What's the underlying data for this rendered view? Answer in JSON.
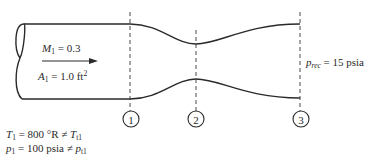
{
  "diagram": {
    "type": "converging-diverging duct (diffuser) schematic",
    "inlet": {
      "mach_symbol": "M",
      "mach_sub": "1",
      "mach_value": " = 0.3",
      "area_symbol": "A",
      "area_sub": "1",
      "area_value": " = 1.0 ft",
      "area_sup": "2",
      "flow_arrow": "arrow-right"
    },
    "conditions": {
      "temp_symbol": "T",
      "temp_sub": "1",
      "temp_value": " = 800 °R ≠ ",
      "temp_total_symbol": "T",
      "temp_total_sub": "t1",
      "press_symbol": "p",
      "press_sub": "1",
      "press_value": " = 100 psia ≠ ",
      "press_total_symbol": "p",
      "press_total_sub": "t1"
    },
    "receiver": {
      "symbol": "p",
      "sub": "rec",
      "value": " = 15 psia"
    },
    "stations": [
      {
        "label": "1"
      },
      {
        "label": "2"
      },
      {
        "label": "3"
      }
    ],
    "colors": {
      "ink": "#2a2a2a",
      "background": "#ffffff"
    }
  }
}
